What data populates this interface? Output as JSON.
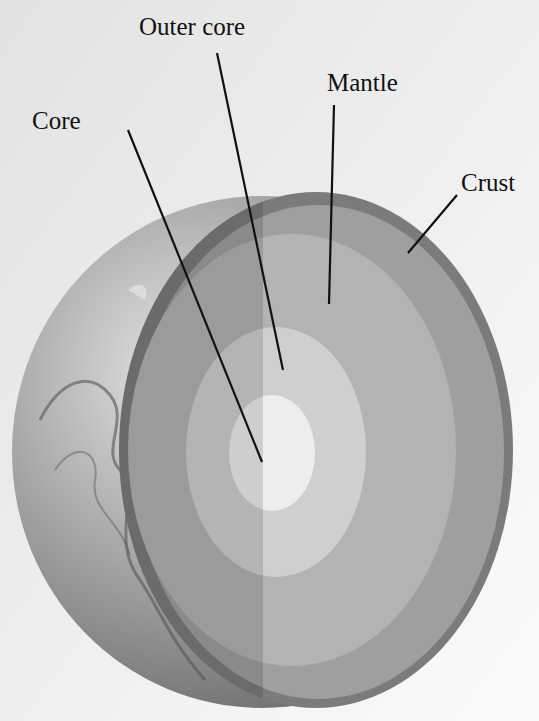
{
  "diagram": {
    "labels": [
      {
        "id": "outer-core",
        "text": "Outer core"
      },
      {
        "id": "mantle",
        "text": "Mantle"
      },
      {
        "id": "core",
        "text": "Core"
      },
      {
        "id": "crust",
        "text": "Crust"
      }
    ],
    "colors": {
      "background": "#ececec",
      "crust": "#7b7b7b",
      "outer_mantle": "#9f9f9f",
      "inner_mantle": "#b3b3b3",
      "outer_core": "#cfcfcf",
      "core": "#ededed",
      "leader_line": "#111111"
    }
  }
}
